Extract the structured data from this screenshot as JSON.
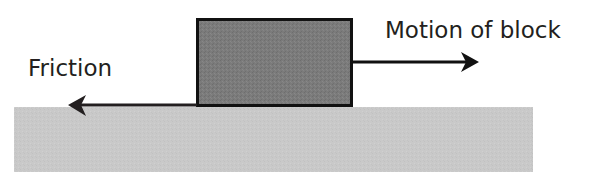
{
  "diagram": {
    "type": "free-body / friction diagram",
    "labels": {
      "friction": "Friction",
      "motion": "Motion of block"
    },
    "elements": {
      "ground": {
        "description": "Horizontal surface",
        "color": "#c9c9c9"
      },
      "block": {
        "description": "Block resting on surface",
        "fill": "#7b7b7b",
        "stroke": "#111111"
      },
      "friction_arrow": {
        "direction": "left",
        "color": "#231f20"
      },
      "motion_arrow": {
        "direction": "right",
        "color": "#111111"
      }
    }
  }
}
